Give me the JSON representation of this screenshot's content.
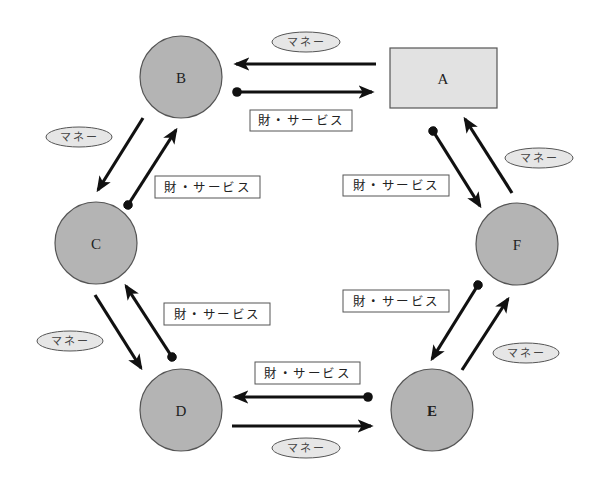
{
  "diagram": {
    "type": "circular-flow",
    "colors": {
      "circle_fill": "#b4b4b4",
      "rect_fill": "#e2e2e2",
      "arrow": "#111111",
      "money_ellipse": "#e6e6e6"
    },
    "nodes": [
      {
        "id": "A",
        "label": "A",
        "shape": "rect"
      },
      {
        "id": "B",
        "label": "B",
        "shape": "circle"
      },
      {
        "id": "C",
        "label": "C",
        "shape": "circle"
      },
      {
        "id": "D",
        "label": "D",
        "shape": "circle"
      },
      {
        "id": "E",
        "label": "E",
        "shape": "circle"
      },
      {
        "id": "F",
        "label": "F",
        "shape": "circle"
      }
    ],
    "labels": {
      "money": "マネー",
      "goods": "財・サービス"
    },
    "flows": [
      {
        "pair": "A-B",
        "money_from": "A",
        "money_to": "B",
        "goods_from": "B",
        "goods_to": "A",
        "money_label": "マネー",
        "goods_label": "財・サービス"
      },
      {
        "pair": "B-C",
        "money_from": "B",
        "money_to": "C",
        "goods_from": "C",
        "goods_to": "B",
        "money_label": "マネー",
        "goods_label": "財・サービス"
      },
      {
        "pair": "C-D",
        "money_from": "C",
        "money_to": "D",
        "goods_from": "D",
        "goods_to": "C",
        "money_label": "マネー",
        "goods_label": "財・サービス"
      },
      {
        "pair": "D-E",
        "money_from": "D",
        "money_to": "E",
        "goods_from": "E",
        "goods_to": "D",
        "money_label": "マネー",
        "goods_label": "財・サービス"
      },
      {
        "pair": "E-F",
        "money_from": "E",
        "money_to": "F",
        "goods_from": "F",
        "goods_to": "E",
        "money_label": "マネー",
        "goods_label": "財・サービス"
      },
      {
        "pair": "F-A",
        "money_from": "F",
        "money_to": "A",
        "goods_from": "A",
        "goods_to": "F",
        "money_label": "マネー",
        "goods_label": "財・サービス"
      }
    ]
  }
}
